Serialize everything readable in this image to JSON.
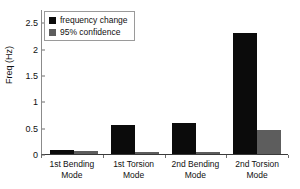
{
  "chart_data": {
    "type": "bar",
    "title": "",
    "xlabel": "",
    "ylabel": "Freq (Hz)",
    "categories": [
      "1st Bending Mode",
      "1st Torsion Mode",
      "2nd Bending Mode",
      "2nd Torsion Mode"
    ],
    "category_lines": [
      {
        "line1": "1st  Bending",
        "line2": "Mode"
      },
      {
        "line1": "1st  Torsion",
        "line2": "Mode"
      },
      {
        "line1": "2nd  Bending",
        "line2": "Mode"
      },
      {
        "line1": "2nd  Torsion",
        "line2": "Mode"
      }
    ],
    "series": [
      {
        "name": "frequency change",
        "color": "#0b0b0b",
        "values": [
          0.07,
          0.55,
          0.59,
          2.29
        ]
      },
      {
        "name": "95% confidence",
        "color": "#5d5d5d",
        "values": [
          0.06,
          0.04,
          0.03,
          0.45
        ]
      }
    ],
    "ylim": [
      0,
      2.75
    ],
    "yticks": [
      0,
      0.5,
      1,
      1.5,
      2,
      2.5
    ],
    "ytick_labels": [
      "0",
      "0.5",
      "1",
      "1.5",
      "2",
      "2.5"
    ],
    "grid": false,
    "legend_position": "top-left"
  },
  "legend": {
    "items": [
      {
        "label": "frequency change",
        "swatch": "black-square-icon"
      },
      {
        "label": "95% confidence",
        "swatch": "gray-square-icon"
      }
    ]
  }
}
